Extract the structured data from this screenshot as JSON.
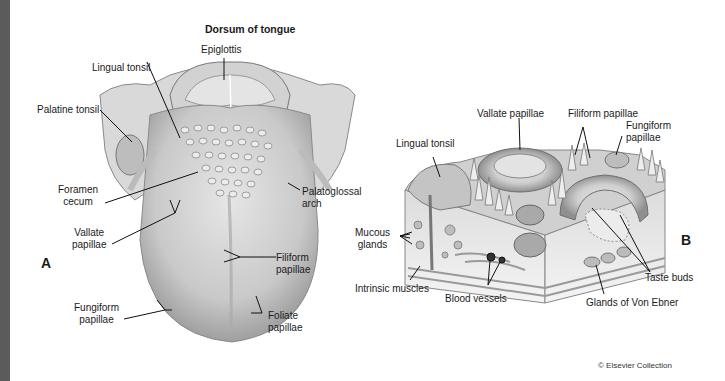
{
  "figure": {
    "title": "Dorsum of tongue",
    "panels": [
      "A",
      "B"
    ],
    "copyright": "© Elsevier Collection"
  },
  "panel_a": {
    "labels": {
      "epiglottis": "Epiglottis",
      "lingual_tonsil": "Lingual tonsil",
      "palatine_tonsil": "Palatine tonsil",
      "foramen_cecum": [
        "Foramen",
        "cecum"
      ],
      "palatoglossal_arch": [
        "Palatoglossal",
        "arch"
      ],
      "vallate_papillae": [
        "Vallate",
        "papillae"
      ],
      "filiform_papillae": [
        "Filiform",
        "papillae"
      ],
      "fungiform_papillae": [
        "Fungiform",
        "papillae"
      ],
      "foliate_papillae": [
        "Foliate",
        "papillae"
      ]
    }
  },
  "panel_b": {
    "labels": {
      "vallate_papillae": "Vallate papillae",
      "filiform_papillae": "Filiform papillae",
      "fungiform_papillae": [
        "Fungiform",
        "papillae"
      ],
      "lingual_tonsil": "Lingual tonsil",
      "mucous_glands": [
        "Mucous",
        "glands"
      ],
      "intrinsic_muscles": "Intrinsic muscles",
      "blood_vessels": "Blood vessels",
      "taste_buds": "Taste buds",
      "glands_von_ebner": "Glands of Von Ebner"
    }
  }
}
